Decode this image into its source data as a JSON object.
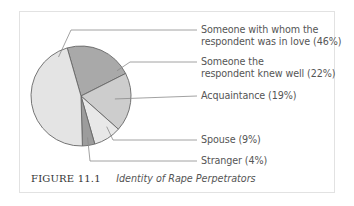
{
  "chart_data": {
    "type": "pie",
    "title": "Identity of Rape Perpetrators",
    "figure_number": "FIGURE 11.1",
    "categories": [
      "Someone with whom the respondent was in love",
      "Someone the respondent knew well",
      "Acquaintance",
      "Spouse",
      "Stranger"
    ],
    "values": [
      46,
      22,
      19,
      9,
      4
    ],
    "unit": "%",
    "colors": [
      "#e4e4e4",
      "#a9a9a9",
      "#cdcdcd",
      "#e8e8e8",
      "#9c9c9c"
    ],
    "legend_position": "right (leader lines)"
  },
  "labels": [
    {
      "line1": "Someone with whom the",
      "line2": "respondent was in love (46%)"
    },
    {
      "line1": "Someone the",
      "line2": "respondent knew well (22%)"
    },
    {
      "line1": "Acquaintance (19%)"
    },
    {
      "line1": "Spouse (9%)"
    },
    {
      "line1": "Stranger (4%)"
    }
  ],
  "caption": {
    "figure": "FIGURE 11.1",
    "title": "Identity of Rape Perpetrators"
  }
}
